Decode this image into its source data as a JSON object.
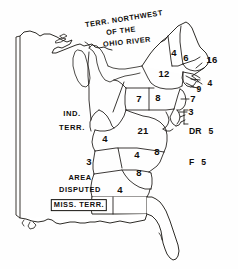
{
  "map": {
    "kind": "historical-electoral-map",
    "title_lines": [
      "TERR. NORTHWEST",
      "OF THE",
      "OHIO RIVER"
    ],
    "territories": [
      {
        "id": "indiana-territory",
        "lines": [
          "IND.",
          "TERR."
        ],
        "x": 72,
        "y": 120
      },
      {
        "id": "area-disputed",
        "lines": [
          "AREA",
          "DISPUTED"
        ],
        "x": 79,
        "y": 185
      },
      {
        "id": "mississippi-territory",
        "lines": [
          "MISS. TERR."
        ],
        "x": 79,
        "y": 204
      }
    ],
    "electoral_votes": [
      {
        "id": "vermont",
        "value": "4",
        "x": 174,
        "y": 53
      },
      {
        "id": "new-hampshire",
        "value": "6",
        "x": 185,
        "y": 58
      },
      {
        "id": "massachusetts",
        "value": "16",
        "x": 211,
        "y": 60
      },
      {
        "id": "new-york",
        "value": "12",
        "x": 164,
        "y": 74
      },
      {
        "id": "connecticut",
        "value": "9",
        "x": 197,
        "y": 89
      },
      {
        "id": "rhode-island",
        "value": "4",
        "x": 209,
        "y": 83
      },
      {
        "id": "new-jersey",
        "value": "7",
        "x": 192,
        "y": 99
      },
      {
        "id": "delaware",
        "value": "3",
        "x": 190,
        "y": 112
      },
      {
        "id": "ohio",
        "value": "7",
        "x": 139,
        "y": 99
      },
      {
        "id": "pennsylvania",
        "value": "8",
        "x": 158,
        "y": 98
      },
      {
        "id": "virginia",
        "value": "21",
        "x": 143,
        "y": 131
      },
      {
        "id": "kentucky",
        "value": "4",
        "x": 105,
        "y": 139
      },
      {
        "id": "tennessee",
        "value": "3",
        "x": 89,
        "y": 162
      },
      {
        "id": "north-carolina",
        "value": "4",
        "x": 137,
        "y": 155
      },
      {
        "id": "north-carolina-east",
        "value": "8",
        "x": 157,
        "y": 152
      },
      {
        "id": "south-carolina",
        "value": "8",
        "x": 139,
        "y": 173
      },
      {
        "id": "georgia",
        "value": "4",
        "x": 120,
        "y": 190
      }
    ],
    "bracket_labels": {
      "x": 186,
      "y": 114,
      "rows": [
        {
          "abbr": "DR",
          "value": "5"
        },
        {
          "abbr": "F",
          "value": "5"
        }
      ]
    },
    "colors": {
      "ink": "#15130f",
      "paper": "#ffffff"
    }
  }
}
